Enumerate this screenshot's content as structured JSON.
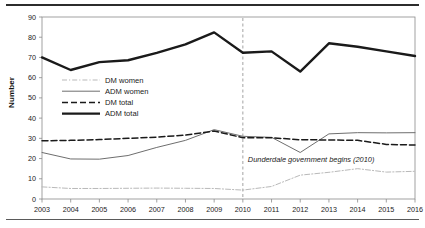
{
  "chart_data": {
    "type": "line",
    "title": "",
    "xlabel": "",
    "ylabel": "Number",
    "x": [
      2003,
      2004,
      2005,
      2006,
      2007,
      2008,
      2009,
      2010,
      2011,
      2012,
      2013,
      2014,
      2015,
      2016
    ],
    "categories": [
      "2003",
      "2004",
      "2005",
      "2006",
      "2007",
      "2008",
      "2009",
      "2010",
      "2011",
      "2012",
      "2013",
      "2014",
      "2015",
      "2016"
    ],
    "ylim": [
      0,
      90
    ],
    "yticks": [
      0,
      10,
      20,
      30,
      40,
      50,
      60,
      70,
      80,
      90
    ],
    "ytick_labels": [
      "0",
      "10",
      "20",
      "30",
      "40",
      "50",
      "60",
      "70",
      "80",
      "90"
    ],
    "grid": false,
    "legend_position": "inside-left",
    "series": [
      {
        "name": "DM women",
        "style": "dash-dot",
        "color": "#b9b9b9",
        "width": 1,
        "values": [
          6,
          5.2,
          5.2,
          5.3,
          5.4,
          5.3,
          5.2,
          4.4,
          6.2,
          11.8,
          13.2,
          15,
          13.3,
          13.7
        ]
      },
      {
        "name": "ADM women",
        "style": "solid",
        "color": "#6e6e6e",
        "width": 1,
        "values": [
          23,
          19.8,
          19.7,
          21.5,
          25.5,
          29,
          34.3,
          31,
          30.5,
          23,
          32.2,
          32.8,
          32.7,
          32.8
        ]
      },
      {
        "name": "DM total",
        "style": "dashed",
        "color": "#1a1a1a",
        "width": 1.5,
        "values": [
          28.8,
          29,
          29.4,
          30,
          30.6,
          31.6,
          33.6,
          30.3,
          30.3,
          29.3,
          29.2,
          29,
          27,
          26.7
        ]
      },
      {
        "name": "ADM total",
        "style": "solid",
        "color": "#1a1a1a",
        "width": 2.4,
        "values": [
          70,
          63.8,
          67.7,
          68.6,
          72.3,
          76.5,
          82.4,
          72.3,
          73,
          63,
          77,
          75.3,
          73,
          70.7
        ]
      }
    ],
    "annotations": [
      {
        "text": "Dunderdale government begins (2010)",
        "x": 2010,
        "style": "italic",
        "marker": "vertical-dashed-line"
      }
    ],
    "vline": {
      "x": 2010,
      "style": "dashed",
      "color": "#9a9a9a"
    }
  }
}
